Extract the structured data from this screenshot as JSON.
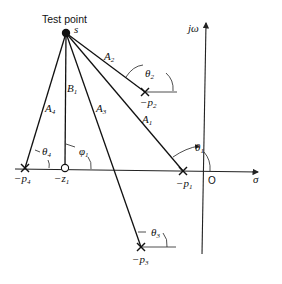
{
  "title": "Test point",
  "test_point": {
    "label": "s",
    "x": 66,
    "y": 33
  },
  "axes": {
    "real_label": "σ",
    "imag_label": "jω",
    "origin_label": "O"
  },
  "poles": [
    {
      "id": "p1",
      "label": "−p",
      "sub": "1",
      "x": 183,
      "y": 171
    },
    {
      "id": "p2",
      "label": "−p",
      "sub": "2",
      "x": 145,
      "y": 92
    },
    {
      "id": "p3",
      "label": "−p",
      "sub": "3",
      "x": 141,
      "y": 247
    },
    {
      "id": "p4",
      "label": "−p",
      "sub": "4",
      "x": 25,
      "y": 168
    }
  ],
  "zeros": [
    {
      "id": "z1",
      "label": "−z",
      "sub": "1",
      "x": 65,
      "y": 168
    }
  ],
  "vectors": [
    {
      "label": "A",
      "sub": "1"
    },
    {
      "label": "A",
      "sub": "2"
    },
    {
      "label": "A",
      "sub": "3"
    },
    {
      "label": "A",
      "sub": "4"
    },
    {
      "label": "B",
      "sub": "1"
    }
  ],
  "angles": [
    {
      "label": "θ",
      "sub": "1"
    },
    {
      "label": "θ",
      "sub": "2"
    },
    {
      "label": "θ",
      "sub": "3"
    },
    {
      "label": "θ",
      "sub": "4"
    },
    {
      "label": "φ",
      "sub": "1"
    }
  ]
}
